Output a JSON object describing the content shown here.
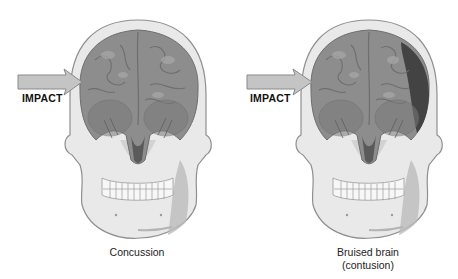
{
  "diagram": {
    "panels": [
      {
        "id": "concussion",
        "impact_label": "IMPACT",
        "caption_lines": [
          "Concussion"
        ],
        "bruise": false
      },
      {
        "id": "contusion",
        "impact_label": "IMPACT",
        "caption_lines": [
          "Bruised brain",
          "(contusion)"
        ],
        "bruise": true
      }
    ],
    "colors": {
      "bone": "#e9e9e9",
      "bone_shadow": "#bcbcbc",
      "bone_outline": "#8f8f8f",
      "brain": "#8d8d8d",
      "brain_fold": "#6e6e6e",
      "brain_highlight": "#a9a9a9",
      "bruise": "#3b3b3b",
      "arrow": "#c4c4c4",
      "arrow_outline": "#8a8a8a"
    }
  }
}
